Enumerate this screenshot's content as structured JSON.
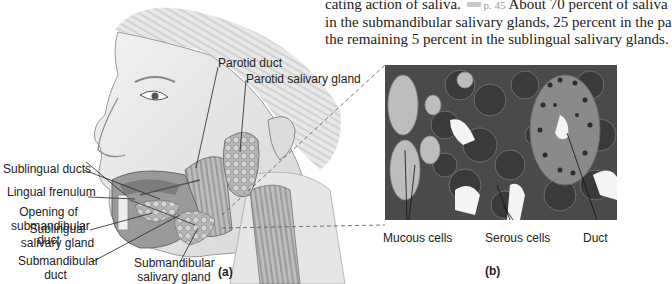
{
  "body_text": {
    "line1_prefix": "cating action of saliva.",
    "page_ref_icon": "page-reference-icon",
    "page_ref": "p. 45",
    "line1_suffix": "About 70 percent of saliva",
    "line2": "in the submandibular salivary glands, 25 percent in the pa",
    "line3": "the remaining 5 percent in the sublingual salivary glands."
  },
  "panel_a": {
    "letter": "(a)",
    "labels": {
      "parotid_duct": "Parotid duct",
      "parotid_gland": "Parotid salivary gland",
      "sublingual_ducts": "Sublingual ducts",
      "lingual_frenulum": "Lingual frenulum",
      "opening_line1": "Opening of",
      "opening_line2": "submandibular",
      "opening_line3": "duct",
      "sublingual_gland_line1": "Sublingual",
      "sublingual_gland_line2": "salivary gland",
      "submandibular_duct_line1": "Submandibular",
      "submandibular_duct_line2": "duct",
      "submandibular_gland_line1": "Submandibular",
      "submandibular_gland_line2": "salivary gland"
    }
  },
  "panel_b": {
    "letter": "(b)",
    "labels": {
      "mucous": "Mucous cells",
      "serous": "Serous cells",
      "duct": "Duct"
    }
  },
  "colors": {
    "tissue_dark": "#3a3a3a",
    "tissue_mid": "#6e6e6e",
    "mucous": "#bdbdbd",
    "duct_fill": "#8a8a8a",
    "lumen": "#f4f4f4"
  }
}
